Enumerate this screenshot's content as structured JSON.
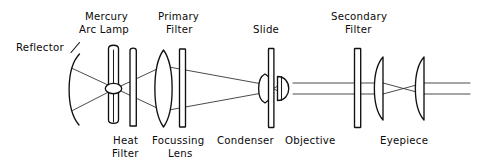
{
  "figure": {
    "background_color": "#ffffff",
    "ink_color": "#111111",
    "width": 479,
    "height": 166
  },
  "labels": {
    "reflector": "Reflector",
    "mercury_arc_lamp_line1": "Mercury",
    "mercury_arc_lamp_line2": "Arc Lamp",
    "primary_filter_line1": "Primary",
    "primary_filter_line2": "Filter",
    "slide": "Slide",
    "secondary_filter_line1": "Secondary",
    "secondary_filter_line2": "Filter",
    "heat_filter_line1": "Heat",
    "heat_filter_line2": "Filter",
    "focussing_lens_line1": "Focussing",
    "focussing_lens_line2": "Lens",
    "condenser": "Condenser",
    "objective": "Objective",
    "eyepiece": "Eyepiece"
  },
  "components": [
    {
      "name": "reflector",
      "kind": "concave-mirror-arc",
      "label": "Reflector",
      "label_position": "top-left"
    },
    {
      "name": "mercury-arc-lamp",
      "kind": "lamp-envelope",
      "label": "Mercury Arc Lamp",
      "label_position": "top"
    },
    {
      "name": "heat-filter",
      "kind": "flat-plate",
      "label": "Heat Filter",
      "label_position": "bottom"
    },
    {
      "name": "focussing-lens",
      "kind": "biconvex-lens",
      "label": "Focussing Lens",
      "label_position": "bottom"
    },
    {
      "name": "primary-filter",
      "kind": "flat-plate",
      "label": "Primary Filter",
      "label_position": "top"
    },
    {
      "name": "condenser",
      "kind": "biconvex-lens",
      "label": "Condenser",
      "label_position": "bottom"
    },
    {
      "name": "slide",
      "kind": "flat-plate-tall",
      "label": "Slide",
      "label_position": "top"
    },
    {
      "name": "objective",
      "kind": "plano-convex-lens",
      "label": "Objective",
      "label_position": "bottom"
    },
    {
      "name": "secondary-filter",
      "kind": "flat-plate-tall",
      "label": "Secondary Filter",
      "label_position": "top"
    },
    {
      "name": "eyepiece-field-lens",
      "kind": "plano-convex-lens",
      "label": "Eyepiece",
      "label_position": "bottom"
    },
    {
      "name": "eyepiece-eye-lens",
      "kind": "plano-convex-lens",
      "label": "Eyepiece",
      "label_position": "bottom"
    }
  ]
}
